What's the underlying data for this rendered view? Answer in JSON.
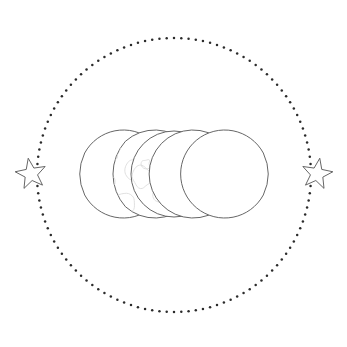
{
  "artwork": {
    "title": "Triple Moon Phases with Stars",
    "alt_text": "Line-art illustration of five moon phases in a horizontal row, flanked by two five-pointed stars, enclosed by a dotted circle",
    "background_color": "#ffffff",
    "canvas": {
      "width": 347,
      "height": 347
    },
    "style": {
      "outline_color": "#555555",
      "outline_width": 0.9,
      "crater_color": "#dcdcdc",
      "crater_width": 0.9,
      "dot_color": "#2b2b2b"
    },
    "dotted_circle": {
      "name": "dotted-circle-border",
      "center_x": 174,
      "center_y": 175,
      "radius": 137,
      "dot_radius": 1.25,
      "dot_count": 118,
      "color": "#2b2b2b"
    },
    "elements": [
      {
        "id": "star-left",
        "label": "Left Star",
        "type": "star",
        "points": 5,
        "center_x": 31,
        "center_y": 174,
        "outer_radius": 16,
        "inner_radius": 6.6,
        "rotation_deg": -10
      },
      {
        "id": "crescent-waning-outer-left",
        "label": "Waning Crescent (outer left)",
        "type": "crescent",
        "facing": "right",
        "center_x": 46,
        "center_y": 174,
        "radius": 44,
        "thickness": 10,
        "craters": false
      },
      {
        "id": "crescent-waning-left",
        "label": "Waning Crescent (left)",
        "type": "crescent",
        "facing": "right",
        "center_x": 96,
        "center_y": 174,
        "radius": 44,
        "thickness": 27,
        "craters": true
      },
      {
        "id": "full-moon",
        "label": "Full Moon",
        "type": "full",
        "center_x": 174,
        "center_y": 174,
        "radius": 43,
        "craters": true
      },
      {
        "id": "crescent-waxing-right",
        "label": "Waxing Crescent (right)",
        "type": "crescent",
        "facing": "left",
        "center_x": 252,
        "center_y": 174,
        "radius": 44,
        "thickness": 27,
        "craters": true
      },
      {
        "id": "crescent-waxing-outer-right",
        "label": "Waxing Crescent (outer right)",
        "type": "crescent",
        "facing": "left",
        "center_x": 302,
        "center_y": 174,
        "radius": 44,
        "thickness": 10,
        "craters": false
      },
      {
        "id": "star-right",
        "label": "Right Star",
        "type": "star",
        "points": 5,
        "center_x": 317,
        "center_y": 174,
        "outer_radius": 16,
        "inner_radius": 6.6,
        "rotation_deg": 10
      }
    ]
  }
}
